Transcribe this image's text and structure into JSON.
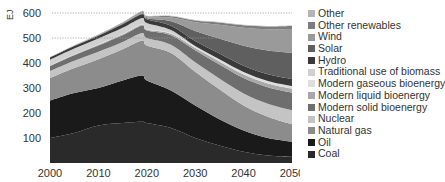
{
  "chart_data": {
    "type": "area",
    "title": "",
    "xlabel": "",
    "ylabel": "EJ",
    "ylim": [
      0,
      650
    ],
    "xlim": [
      2000,
      2050
    ],
    "x_ticks": [
      "2000",
      "2010",
      "2020",
      "2030",
      "2040",
      "2050"
    ],
    "y_ticks": [
      "100",
      "200",
      "300",
      "400",
      "500",
      "600"
    ],
    "gridlines": [
      500,
      600
    ],
    "legend_position": "right",
    "x": [
      2000,
      2005,
      2010,
      2015,
      2019,
      2020,
      2025,
      2030,
      2035,
      2040,
      2045,
      2050
    ],
    "series": [
      {
        "name": "Coal",
        "color": "#2a2a2a",
        "values": [
          100,
          120,
          150,
          160,
          165,
          160,
          140,
          100,
          70,
          45,
          30,
          25
        ]
      },
      {
        "name": "Oil",
        "color": "#1a1a1a",
        "values": [
          150,
          160,
          150,
          170,
          185,
          170,
          150,
          130,
          105,
          85,
          70,
          60
        ]
      },
      {
        "name": "Natural gas",
        "color": "#8c8c8c",
        "values": [
          90,
          100,
          115,
          125,
          140,
          140,
          150,
          135,
          120,
          100,
          85,
          70
        ]
      },
      {
        "name": "Nuclear",
        "color": "#c4c4c4",
        "values": [
          28,
          29,
          30,
          29,
          30,
          30,
          33,
          38,
          43,
          48,
          52,
          56
        ]
      },
      {
        "name": "Modern solid bioenergy",
        "color": "#6e6e6e",
        "values": [
          20,
          22,
          25,
          27,
          30,
          30,
          38,
          48,
          56,
          62,
          66,
          70
        ]
      },
      {
        "name": "Modern liquid bioenergy",
        "color": "#a8a8a8",
        "values": [
          1,
          2,
          3,
          4,
          4,
          4,
          6,
          9,
          12,
          14,
          15,
          16
        ]
      },
      {
        "name": "Modern gaseous bioenergy",
        "color": "#dedede",
        "values": [
          1,
          1,
          1,
          2,
          2,
          2,
          3,
          5,
          7,
          9,
          10,
          11
        ]
      },
      {
        "name": "Traditional use of biomass",
        "color": "#d0d0d0",
        "values": [
          23,
          24,
          24,
          24,
          24,
          24,
          12,
          3,
          2,
          1,
          0,
          0
        ]
      },
      {
        "name": "Hydro",
        "color": "#3a3a3a",
        "values": [
          9,
          10,
          11,
          14,
          15,
          15,
          17,
          20,
          23,
          25,
          27,
          28
        ]
      },
      {
        "name": "Solar",
        "color": "#5f5f5f",
        "values": [
          0,
          0,
          1,
          2,
          3,
          4,
          18,
          40,
          60,
          80,
          95,
          105
        ]
      },
      {
        "name": "Wind",
        "color": "#9a9a9a",
        "values": [
          0,
          1,
          1,
          3,
          5,
          5,
          15,
          35,
          55,
          72,
          85,
          95
        ]
      },
      {
        "name": "Other renewables",
        "color": "#7d7d7d",
        "values": [
          1,
          1,
          2,
          2,
          3,
          3,
          5,
          7,
          9,
          10,
          11,
          12
        ]
      },
      {
        "name": "Other",
        "color": "#b5b5b5",
        "values": [
          0,
          1,
          1,
          1,
          2,
          2,
          2,
          2,
          2,
          2,
          2,
          2
        ]
      }
    ]
  },
  "legend": {
    "items": [
      {
        "label": "Other",
        "color": "#b5b5b5"
      },
      {
        "label": "Other renewables",
        "color": "#7d7d7d"
      },
      {
        "label": "Wind",
        "color": "#9a9a9a"
      },
      {
        "label": "Solar",
        "color": "#5f5f5f"
      },
      {
        "label": "Hydro",
        "color": "#3a3a3a"
      },
      {
        "label": "Traditional use of biomass",
        "color": "#d0d0d0"
      },
      {
        "label": "Modern gaseous bioenergy",
        "color": "#dedede"
      },
      {
        "label": "Modern liquid bioenergy",
        "color": "#a8a8a8"
      },
      {
        "label": "Modern solid bioenergy",
        "color": "#6e6e6e"
      },
      {
        "label": "Nuclear",
        "color": "#c4c4c4"
      },
      {
        "label": "Natural gas",
        "color": "#8c8c8c"
      },
      {
        "label": "Oil",
        "color": "#1a1a1a"
      },
      {
        "label": "Coal",
        "color": "#2a2a2a"
      }
    ]
  }
}
